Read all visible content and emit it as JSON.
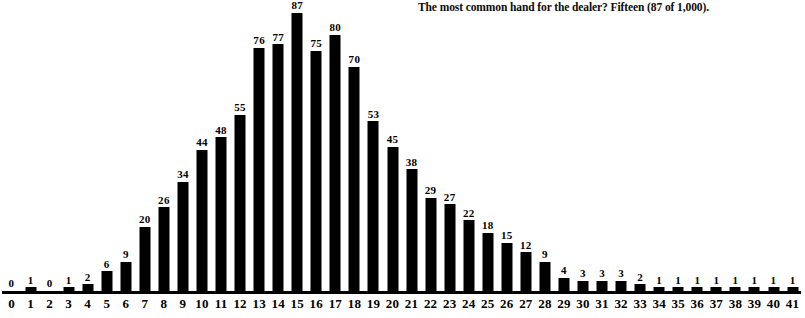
{
  "caption": {
    "text": "The most common hand for the dealer? Fifteen (87 of 1,000)."
  },
  "chart_data": {
    "type": "bar",
    "title": "",
    "subtitle": "",
    "annotations": [
      "The most common hand for the dealer? Fifteen (87 of 1,000)."
    ],
    "xlabel": "",
    "ylabel": "",
    "grid": false,
    "legend": false,
    "legend_position": "none",
    "bar_color": "#000000",
    "data_labels": true,
    "total": 1000,
    "xlim": [
      0,
      41
    ],
    "ylim": [
      0,
      87
    ],
    "categories": [
      "0",
      "1",
      "2",
      "3",
      "4",
      "5",
      "6",
      "7",
      "8",
      "9",
      "10",
      "11",
      "12",
      "13",
      "14",
      "15",
      "16",
      "17",
      "18",
      "19",
      "20",
      "21",
      "22",
      "23",
      "24",
      "25",
      "26",
      "27",
      "28",
      "29",
      "30",
      "31",
      "32",
      "33",
      "34",
      "35",
      "36",
      "37",
      "38",
      "39",
      "40",
      "41"
    ],
    "values": [
      0,
      1,
      0,
      1,
      2,
      6,
      9,
      20,
      26,
      34,
      44,
      48,
      55,
      76,
      77,
      87,
      75,
      80,
      70,
      53,
      45,
      38,
      29,
      27,
      22,
      18,
      15,
      12,
      9,
      4,
      3,
      3,
      3,
      2,
      1,
      1,
      1,
      1,
      1,
      1,
      1,
      1
    ]
  },
  "colors": {
    "bar": "#000000",
    "axis": "#000000",
    "background": "#ffffff",
    "text": "#000000"
  }
}
